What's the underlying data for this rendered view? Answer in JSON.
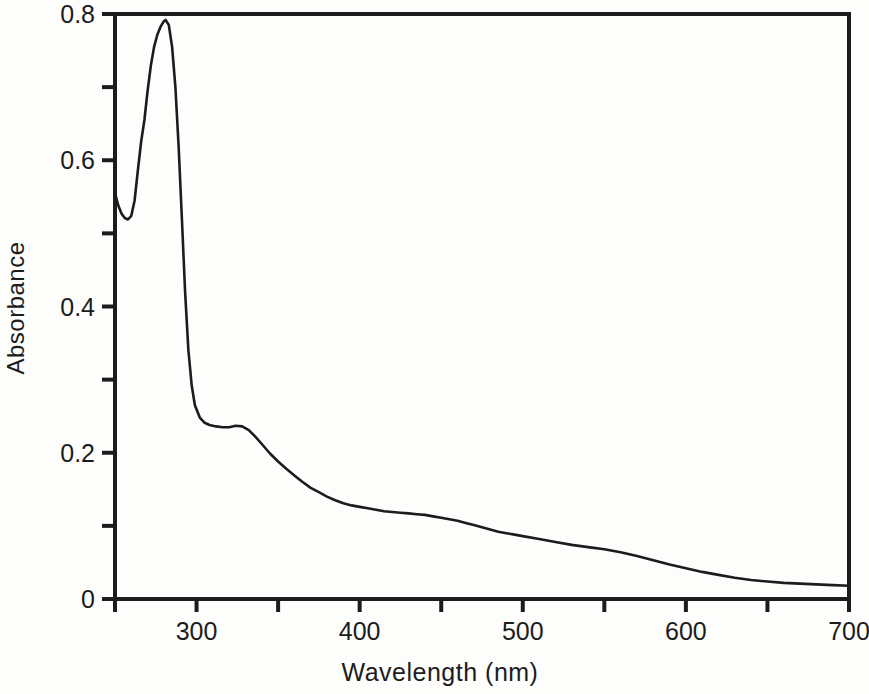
{
  "figure": {
    "xlabel": "Wavelength (nm)",
    "ylabel": "Absorbance"
  },
  "chart_data": {
    "type": "line",
    "title": "",
    "xlabel": "Wavelength (nm)",
    "ylabel": "Absorbance",
    "xlim": [
      250,
      700
    ],
    "ylim": [
      0,
      0.8
    ],
    "grid": false,
    "legend": "none",
    "ink_color": "#1c1c1c",
    "background_color": "#fdfdfc",
    "x_ticks_labeled": [
      300,
      400,
      500,
      600,
      700
    ],
    "x_tick_label_texts": [
      "300",
      "400",
      "500",
      "600",
      "700"
    ],
    "x_ticks_unlabeled": [
      250,
      350,
      450,
      550,
      650
    ],
    "y_ticks_labeled": [
      0,
      0.2,
      0.4,
      0.6,
      0.8
    ],
    "y_tick_label_texts": [
      "0",
      "0.2",
      "0.4",
      "0.6",
      "0.8"
    ],
    "y_ticks_unlabeled": [
      0.1,
      0.3,
      0.5,
      0.7
    ],
    "notable_features": {
      "main_peak": {
        "wavelength_nm": 281,
        "absorbance": 0.79
      },
      "local_minimum": {
        "wavelength_nm": 258,
        "absorbance": 0.52
      },
      "shoulder": {
        "wavelength_nm": 325,
        "absorbance": 0.235
      },
      "end_value": {
        "wavelength_nm": 700,
        "absorbance": 0.02
      }
    },
    "series": [
      {
        "name": "uv-vis-absorbance-spectrum",
        "x": [
          250,
          252,
          254,
          256,
          258,
          260,
          262,
          264,
          266,
          268,
          270,
          272,
          274,
          276,
          278,
          280,
          281,
          283,
          285,
          287,
          289,
          291,
          293,
          295,
          297,
          299,
          302,
          305,
          308,
          312,
          316,
          320,
          324,
          328,
          332,
          336,
          340,
          345,
          350,
          355,
          360,
          365,
          370,
          375,
          380,
          385,
          390,
          395,
          400,
          405,
          410,
          415,
          420,
          425,
          430,
          435,
          440,
          445,
          450,
          455,
          460,
          465,
          470,
          475,
          480,
          485,
          490,
          495,
          500,
          510,
          520,
          530,
          540,
          550,
          560,
          570,
          580,
          590,
          600,
          610,
          620,
          630,
          640,
          650,
          660,
          670,
          680,
          690,
          700
        ],
        "y": [
          0.555,
          0.538,
          0.527,
          0.521,
          0.519,
          0.524,
          0.545,
          0.585,
          0.625,
          0.655,
          0.695,
          0.73,
          0.755,
          0.772,
          0.783,
          0.79,
          0.792,
          0.785,
          0.755,
          0.7,
          0.62,
          0.52,
          0.42,
          0.34,
          0.292,
          0.265,
          0.248,
          0.241,
          0.238,
          0.236,
          0.235,
          0.235,
          0.237,
          0.236,
          0.231,
          0.222,
          0.212,
          0.199,
          0.188,
          0.178,
          0.169,
          0.16,
          0.152,
          0.146,
          0.14,
          0.135,
          0.131,
          0.128,
          0.126,
          0.124,
          0.122,
          0.12,
          0.119,
          0.118,
          0.117,
          0.116,
          0.115,
          0.113,
          0.111,
          0.109,
          0.107,
          0.104,
          0.101,
          0.098,
          0.095,
          0.092,
          0.09,
          0.088,
          0.086,
          0.082,
          0.078,
          0.074,
          0.071,
          0.068,
          0.064,
          0.059,
          0.053,
          0.047,
          0.042,
          0.037,
          0.033,
          0.029,
          0.026,
          0.024,
          0.022,
          0.021,
          0.02,
          0.019,
          0.018
        ]
      }
    ]
  }
}
